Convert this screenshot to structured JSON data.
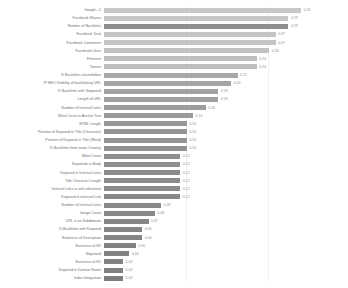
{
  "chart_data": {
    "type": "bar",
    "orientation": "horizontal",
    "title": "",
    "subtitle": "",
    "xlabel": "",
    "ylabel": "",
    "xlim": [
      0,
      0.33
    ],
    "grid": true,
    "legend": null,
    "axis_ticks": [],
    "categories": [
      "Google +1",
      "Facebook Shares",
      "Number of Backlinks",
      "Facebook Total",
      "Facebook Comments",
      "Facebook Likes",
      "Pinterest",
      "Tweets",
      "% Backlinks rel=nofollow",
      "IP SEO Visibility of backlinking URL",
      "% Backlinks with Stopword",
      "Length of URL",
      "Number of Internal Links",
      "Word Count in Anchor Text",
      "HTML Length",
      "Position of Keyword in Title (Character)",
      "Position of Keyword in Title (Word)",
      "% Backlinks from same Country",
      "Word Count",
      "Keywords in Body",
      "Keyword in Internal Links",
      "Title Character Length",
      "Internal Links is self-referential",
      "Keyword in external Link",
      "Number of Internal Links",
      "Image Count",
      "URL is no Subdomain",
      "% Backlinks with Keyword",
      "Existence of Description",
      "Existence of H2",
      "Stopword",
      "Existence of H1",
      "Keyword in Domain Name",
      "Index Integration"
    ],
    "values": [
      0.31,
      0.29,
      0.29,
      0.27,
      0.27,
      0.26,
      0.24,
      0.24,
      0.21,
      0.2,
      0.18,
      0.18,
      0.16,
      0.14,
      0.13,
      0.13,
      0.13,
      0.13,
      0.12,
      0.12,
      0.12,
      0.12,
      0.12,
      0.12,
      0.09,
      0.08,
      0.07,
      0.06,
      0.06,
      0.05,
      0.04,
      0.03,
      0.03,
      0.03
    ],
    "value_labels": [
      "0.31",
      "0.29",
      "0.29",
      "0.27",
      "0.27",
      "0.26",
      "0.24",
      "0.24",
      "0.21",
      "0.20",
      "0.18",
      "0.18",
      "0.16",
      "0.14",
      "0.13",
      "0.13",
      "0.13",
      "0.13",
      "0.12",
      "0.12",
      "0.12",
      "0.12",
      "0.12",
      "0.12",
      "0.09",
      "0.08",
      "0.07",
      "0.06",
      "0.06",
      "0.05",
      "0.04",
      "0.03",
      "0.03",
      "0.03"
    ],
    "bar_colors": [
      "#c8c8c8",
      "#c6c6c6",
      "#8e8e8e",
      "#c4c4c4",
      "#c4c4c4",
      "#c2c2c2",
      "#bfbfbf",
      "#bdbdbd",
      "#a8a8a8",
      "#a5a5a5",
      "#a2a2a2",
      "#a0a0a0",
      "#9d9d9d",
      "#9a9a9a",
      "#989898",
      "#959595",
      "#939393",
      "#919191",
      "#8f8f8f",
      "#8e8e8e",
      "#8c8c8c",
      "#8b8b8b",
      "#8a8a8a",
      "#898989",
      "#888888",
      "#878787",
      "#868686",
      "#858585",
      "#848484",
      "#838383",
      "#828282",
      "#818181",
      "#808080",
      "#7f7f7f"
    ]
  }
}
